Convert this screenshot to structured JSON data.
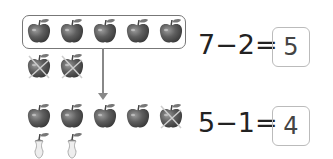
{
  "problem1": {
    "equation": "7−2=",
    "answer": "5",
    "grouped_apples": 5,
    "crossed_apples": 2
  },
  "problem2": {
    "equation": "5−1=",
    "answer": "4",
    "whole_apples": 4,
    "crossed_apples": 1,
    "apple_cores": 2
  },
  "colors": {
    "apple": "#5a5a5a",
    "box_border": "#777777",
    "answer_box_border": "#bbbbbb",
    "text": "#222222"
  }
}
